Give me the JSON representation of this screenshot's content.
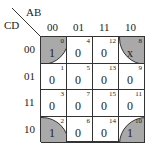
{
  "row_var": "CD",
  "col_var": "AB",
  "col_labels": [
    "00",
    "01",
    "11",
    "10"
  ],
  "row_labels": [
    "00",
    "01",
    "11",
    "10"
  ],
  "cells": [
    [
      {
        "v": "1",
        "i": "0"
      },
      {
        "v": "0",
        "i": "4"
      },
      {
        "v": "0",
        "i": "12"
      },
      {
        "v": "x",
        "i": "8"
      }
    ],
    [
      {
        "v": "0",
        "i": "1"
      },
      {
        "v": "0",
        "i": "5"
      },
      {
        "v": "0",
        "i": "13"
      },
      {
        "v": "0",
        "i": "9"
      }
    ],
    [
      {
        "v": "0",
        "i": "3"
      },
      {
        "v": "0",
        "i": "7"
      },
      {
        "v": "0",
        "i": "15"
      },
      {
        "v": "0",
        "i": "11"
      }
    ],
    [
      {
        "v": "1",
        "i": "2"
      },
      {
        "v": "0",
        "i": "6"
      },
      {
        "v": "0",
        "i": "14"
      },
      {
        "v": "1",
        "i": "10"
      }
    ]
  ],
  "grouping": "four corners (cells 0, 2, 8, 10)",
  "shade_color": "#a9a9a9"
}
